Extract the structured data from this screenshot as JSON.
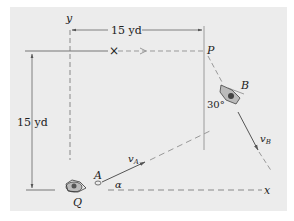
{
  "diagram": {
    "axes": {
      "x_label": "x",
      "y_label": "y"
    },
    "points": {
      "P": "P",
      "A": "A",
      "B": "B",
      "Q": "Q"
    },
    "dimensions": {
      "horizontal": "15 yd",
      "vertical": "15 yd"
    },
    "angles": {
      "alpha": "α",
      "b_angle": "30°"
    },
    "velocities": {
      "vA_main": "v",
      "vA_sub": "A",
      "vB_main": "v",
      "vB_sub": "B"
    },
    "markers": {
      "cross": "×"
    },
    "colors": {
      "background": "#ececec",
      "line": "#555555",
      "dashed": "#888888",
      "text": "#222222"
    }
  }
}
